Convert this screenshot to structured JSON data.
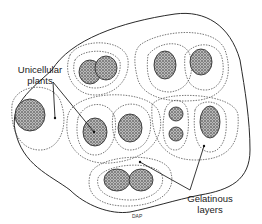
{
  "diagram": {
    "labels": {
      "unicellular_line1": "Unicellular",
      "unicellular_line2": "plants",
      "gelatinous_line1": "Gelatinous",
      "gelatinous_line2": "layers",
      "credit": "DAP"
    },
    "colors": {
      "outline": "#2a2a2a",
      "dotted": "#555555",
      "cell_fill": "#8a8a8a",
      "background": "#ffffff"
    }
  }
}
